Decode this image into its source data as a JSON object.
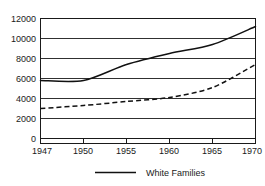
{
  "chart_data": {
    "type": "line",
    "title": "",
    "xlabel": "",
    "ylabel": "",
    "x": [
      1947,
      1950,
      1955,
      1960,
      1965,
      1970
    ],
    "xtick_labels": [
      "1947",
      "1950",
      "1955",
      "1960",
      "1965",
      "1970"
    ],
    "ytick_labels": [
      "0",
      "2000",
      "4000",
      "6000",
      "8000",
      "10000",
      "12000"
    ],
    "ytick_values": [
      0,
      2000,
      4000,
      6000,
      8000,
      10000,
      12000
    ],
    "ylim": [
      0,
      12000
    ],
    "grid": true,
    "legend_position": "bottom",
    "series": [
      {
        "name": "White Families",
        "style": "solid",
        "color": "#111111",
        "x": [
          1947,
          1950,
          1955,
          1960,
          1965,
          1970
        ],
        "values": [
          5800,
          5800,
          7400,
          8500,
          9400,
          11200
        ]
      },
      {
        "name": "",
        "style": "dashed",
        "color": "#111111",
        "x": [
          1947,
          1950,
          1955,
          1960,
          1965,
          1970
        ],
        "values": [
          3000,
          3300,
          3700,
          4100,
          5100,
          7400
        ]
      }
    ],
    "legend": [
      {
        "label": "White Families",
        "style": "solid",
        "color": "#111111"
      }
    ]
  },
  "axis": {
    "y_labels": [
      "12000",
      "10000",
      "8000",
      "6000",
      "4000",
      "2000",
      "0"
    ],
    "x_labels": [
      "1947",
      "1950",
      "1955",
      "1960",
      "1965",
      "1970"
    ]
  },
  "legend": {
    "entry_0_label": "White Families"
  }
}
